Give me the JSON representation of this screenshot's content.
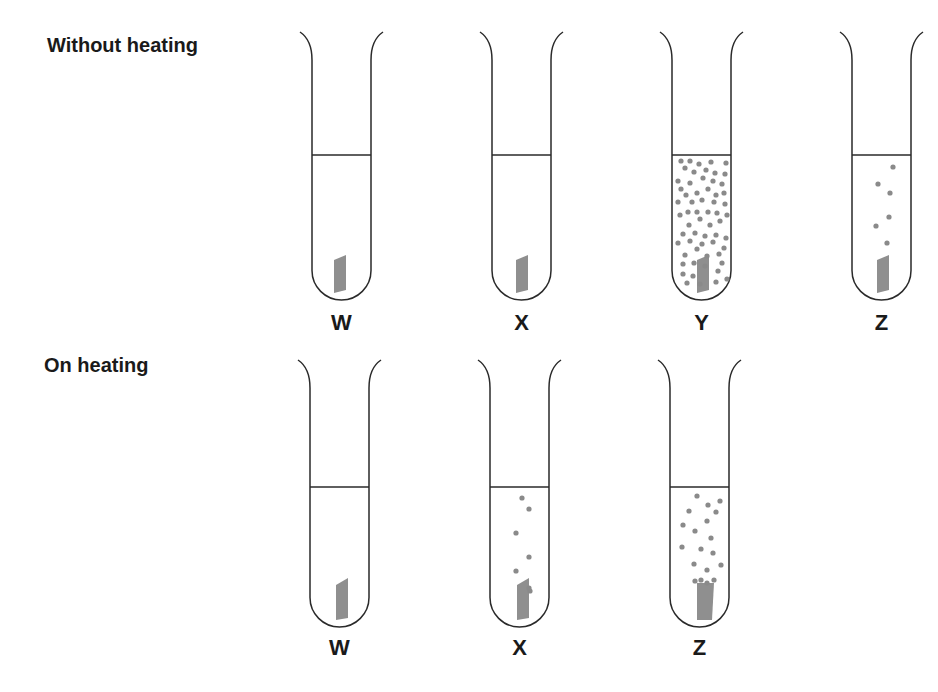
{
  "rows": [
    {
      "title": "Without heating",
      "tubes": [
        {
          "label": "W",
          "x": 312,
          "top": 32,
          "liquid": 155,
          "bottom": 300,
          "strip": [
            [
              334,
              260
            ],
            [
              346,
              255
            ],
            [
              346,
              290
            ],
            [
              334,
              293
            ]
          ],
          "bubbles": []
        },
        {
          "label": "X",
          "x": 492,
          "top": 32,
          "liquid": 155,
          "bottom": 300,
          "strip": [
            [
              516,
              260
            ],
            [
              528,
              255
            ],
            [
              528,
              290
            ],
            [
              516,
              293
            ]
          ],
          "bubbles": []
        },
        {
          "label": "Y",
          "x": 672,
          "top": 32,
          "liquid": 155,
          "bottom": 300,
          "strip": [
            [
              697,
              260
            ],
            [
              709,
              255
            ],
            [
              709,
              290
            ],
            [
              697,
              293
            ]
          ],
          "bubbles": [
            [
              681,
              161
            ],
            [
              690,
              161
            ],
            [
              699,
              164
            ],
            [
              711,
              162
            ],
            [
              726,
              163
            ],
            [
              685,
              168
            ],
            [
              694,
              172
            ],
            [
              706,
              170
            ],
            [
              715,
              173
            ],
            [
              725,
              174
            ],
            [
              678,
              181
            ],
            [
              690,
              183
            ],
            [
              703,
              178
            ],
            [
              713,
              181
            ],
            [
              722,
              184
            ],
            [
              681,
              189
            ],
            [
              686,
              195
            ],
            [
              697,
              193
            ],
            [
              708,
              189
            ],
            [
              716,
              195
            ],
            [
              724,
              193
            ],
            [
              678,
              202
            ],
            [
              692,
              202
            ],
            [
              702,
              200
            ],
            [
              714,
              202
            ],
            [
              725,
              204
            ],
            [
              680,
              215
            ],
            [
              688,
              212
            ],
            [
              697,
              212
            ],
            [
              708,
              212
            ],
            [
              717,
              213
            ],
            [
              727,
              215
            ],
            [
              689,
              225
            ],
            [
              700,
              219
            ],
            [
              710,
              225
            ],
            [
              720,
              221
            ],
            [
              683,
              234
            ],
            [
              695,
              233
            ],
            [
              705,
              236
            ],
            [
              716,
              235
            ],
            [
              726,
              238
            ],
            [
              678,
              243
            ],
            [
              690,
              241
            ],
            [
              702,
              244
            ],
            [
              713,
              242
            ],
            [
              724,
              248
            ],
            [
              685,
              255
            ],
            [
              697,
              249
            ],
            [
              707,
              256
            ],
            [
              719,
              254
            ],
            [
              683,
              264
            ],
            [
              694,
              263
            ],
            [
              705,
              266
            ],
            [
              722,
              263
            ],
            [
              683,
              274
            ],
            [
              693,
              276
            ],
            [
              718,
              271
            ],
            [
              687,
              283
            ],
            [
              700,
              284
            ],
            [
              716,
              282
            ],
            [
              727,
              279
            ]
          ]
        },
        {
          "label": "Z",
          "x": 852,
          "top": 32,
          "liquid": 155,
          "bottom": 300,
          "strip": [
            [
              877,
              260
            ],
            [
              889,
              255
            ],
            [
              889,
              290
            ],
            [
              877,
              293
            ]
          ],
          "bubbles": [
            [
              893,
              167
            ],
            [
              878,
              184
            ],
            [
              890,
              193
            ],
            [
              889,
              217
            ],
            [
              876,
              226
            ],
            [
              887,
              243
            ]
          ]
        }
      ],
      "label_y": 330
    },
    {
      "title": "On heating",
      "tubes": [
        {
          "label": "W",
          "x": 310,
          "top": 360,
          "liquid": 487,
          "bottom": 627,
          "strip": [
            [
              336,
              585
            ],
            [
              348,
              578
            ],
            [
              348,
              618
            ],
            [
              336,
              620
            ]
          ],
          "bubbles": []
        },
        {
          "label": "X",
          "x": 490,
          "top": 360,
          "liquid": 487,
          "bottom": 627,
          "strip": [
            [
              517,
              585
            ],
            [
              529,
              578
            ],
            [
              529,
              618
            ],
            [
              517,
              620
            ]
          ],
          "bubbles": [
            [
              522,
              498
            ],
            [
              529,
              509
            ],
            [
              516,
              533
            ],
            [
              529,
              557
            ],
            [
              516,
              571
            ],
            [
              529,
              588
            ],
            [
              530,
              591
            ]
          ]
        },
        {
          "label": "Z",
          "x": 670,
          "top": 360,
          "liquid": 487,
          "bottom": 627,
          "strip": [
            [
              697,
              583
            ],
            [
              714,
              583
            ],
            [
              712,
              620
            ],
            [
              697,
              620
            ]
          ],
          "bubbles": [
            [
              697,
              496
            ],
            [
              708,
              505
            ],
            [
              720,
              501
            ],
            [
              689,
              511
            ],
            [
              716,
              512
            ],
            [
              707,
              521
            ],
            [
              683,
              525
            ],
            [
              695,
              531
            ],
            [
              711,
              538
            ],
            [
              682,
              547
            ],
            [
              701,
              549
            ],
            [
              713,
              553
            ],
            [
              694,
              564
            ],
            [
              707,
              570
            ],
            [
              721,
              565
            ],
            [
              695,
              581
            ],
            [
              701,
              580
            ],
            [
              707,
              583
            ],
            [
              714,
              580
            ]
          ]
        }
      ],
      "label_y": 655
    }
  ],
  "colors": {
    "line": "#2a2a2a",
    "bubble": "#8a8a8a",
    "strip": "#8f8f8f",
    "text": "#1a1a1a"
  }
}
